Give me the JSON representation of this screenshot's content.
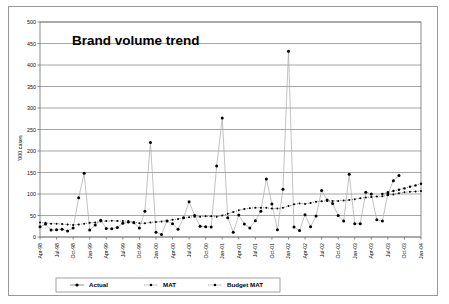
{
  "chart": {
    "title": "Brand volume trend",
    "ylabel": "'000 cases"
  },
  "legend": {
    "items": [
      {
        "label": "Actual",
        "marker": "diamond-marker",
        "line": "solid"
      },
      {
        "label": "MAT",
        "marker": "dot-marker",
        "line": "dotted"
      },
      {
        "label": "Budget MAT",
        "marker": "dot-marker",
        "line": "dotted"
      }
    ]
  },
  "chart_data": {
    "type": "line",
    "title": "Brand volume trend",
    "xlabel": "",
    "ylabel": "'000 cases",
    "ylim": [
      0,
      500
    ],
    "ytick_values": [
      0,
      50,
      100,
      150,
      200,
      250,
      300,
      350,
      400,
      450,
      500
    ],
    "grid": true,
    "legend_position": "bottom",
    "xtick_labels": [
      "Apr-98",
      "Jul-98",
      "Oct-98",
      "Jan-99",
      "Apr-99",
      "Jul-99",
      "Oct-99",
      "Jan-00",
      "Apr-00",
      "Jul-00",
      "Oct-00",
      "Jan-01",
      "Apr-01",
      "Jul-01",
      "Oct-01",
      "Jan-02",
      "Apr-02",
      "Jul-02",
      "Oct-02",
      "Jan-03",
      "Apr-03",
      "Jul-03",
      "Oct-03",
      "Jan-04"
    ],
    "x": [
      "Apr-98",
      "May-98",
      "Jun-98",
      "Jul-98",
      "Aug-98",
      "Sep-98",
      "Oct-98",
      "Nov-98",
      "Dec-98",
      "Jan-99",
      "Feb-99",
      "Mar-99",
      "Apr-99",
      "May-99",
      "Jun-99",
      "Jul-99",
      "Aug-99",
      "Sep-99",
      "Oct-99",
      "Nov-99",
      "Dec-99",
      "Jan-00",
      "Feb-00",
      "Mar-00",
      "Apr-00",
      "May-00",
      "Jun-00",
      "Jul-00",
      "Aug-00",
      "Sep-00",
      "Oct-00",
      "Nov-00",
      "Dec-00",
      "Jan-01",
      "Feb-01",
      "Mar-01",
      "Apr-01",
      "May-01",
      "Jun-01",
      "Jul-01",
      "Aug-01",
      "Sep-01",
      "Oct-01",
      "Nov-01",
      "Dec-01",
      "Jan-02",
      "Feb-02",
      "Mar-02",
      "Apr-02",
      "May-02",
      "Jun-02",
      "Jul-02",
      "Aug-02",
      "Sep-02",
      "Oct-02",
      "Nov-02",
      "Dec-02",
      "Jan-03",
      "Feb-03",
      "Mar-03",
      "Apr-03",
      "May-03",
      "Jun-03",
      "Jul-03",
      "Aug-03",
      "Sep-03",
      "Oct-03",
      "Nov-03",
      "Dec-03",
      "Jan-04"
    ],
    "series": [
      {
        "name": "Actual",
        "values": [
          24,
          30,
          16,
          17,
          18,
          14,
          21,
          91,
          148,
          16,
          28,
          39,
          20,
          19,
          22,
          32,
          35,
          33,
          21,
          60,
          220,
          11,
          6,
          37,
          31,
          18,
          45,
          82,
          50,
          25,
          24,
          23,
          165,
          277,
          45,
          11,
          51,
          30,
          21,
          38,
          60,
          135,
          77,
          17,
          111,
          432,
          23,
          15,
          52,
          24,
          49,
          108,
          86,
          78,
          50,
          37,
          146,
          31,
          31,
          104,
          100,
          40,
          37,
          100,
          131,
          143,
          null,
          null,
          null,
          null
        ]
      },
      {
        "name": "MAT",
        "values": [
          34,
          33,
          31,
          31,
          30,
          29,
          28,
          29,
          31,
          33,
          34,
          36,
          37,
          38,
          37,
          37,
          37,
          35,
          32,
          32,
          34,
          35,
          36,
          38,
          40,
          42,
          44,
          46,
          47,
          47,
          48,
          48,
          47,
          50,
          54,
          58,
          62,
          65,
          67,
          68,
          68,
          68,
          66,
          66,
          68,
          72,
          76,
          78,
          77,
          79,
          82,
          83,
          84,
          84,
          84,
          85,
          86,
          88,
          90,
          92,
          93,
          94,
          95,
          97,
          99,
          102,
          104,
          105,
          106,
          107
        ]
      },
      {
        "name": "Budget MAT",
        "values": [
          null,
          null,
          null,
          null,
          null,
          null,
          null,
          null,
          null,
          null,
          null,
          null,
          null,
          null,
          null,
          null,
          null,
          null,
          null,
          null,
          null,
          null,
          null,
          null,
          null,
          null,
          null,
          null,
          null,
          null,
          null,
          null,
          null,
          null,
          null,
          null,
          null,
          null,
          null,
          null,
          null,
          null,
          null,
          null,
          null,
          null,
          null,
          null,
          null,
          null,
          null,
          null,
          null,
          null,
          null,
          null,
          null,
          null,
          null,
          null,
          null,
          null,
          100,
          104,
          107,
          110,
          113,
          117,
          120,
          124
        ]
      }
    ]
  }
}
